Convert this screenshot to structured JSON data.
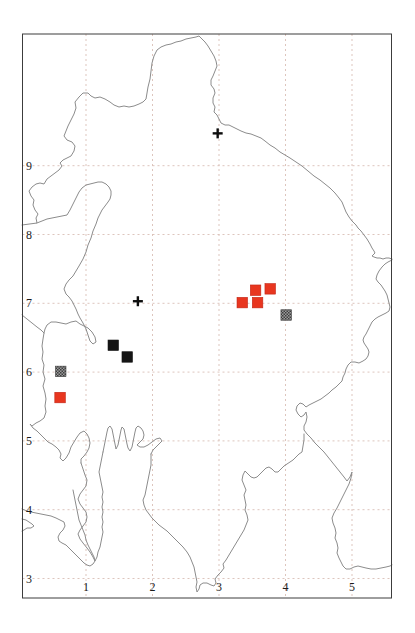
{
  "figure": {
    "kind": "grid-distribution-map",
    "background": "#ffffff"
  },
  "frame": {
    "left": 22.5,
    "top": 34,
    "right": 391.5,
    "bottom": 598,
    "stroke": "#3c3c3c",
    "stroke_width": 1
  },
  "axes": {
    "x_ticks": [
      "1",
      "2",
      "3",
      "4",
      "5"
    ],
    "y_ticks": [
      "9",
      "8",
      "7",
      "6",
      "5",
      "4",
      "3"
    ],
    "label_color": "#1c1c1c",
    "label_size": 12,
    "x_label_y": 591,
    "y_label_x": 29
  },
  "calibration": {
    "x0": 19.5,
    "x_per_unit": 66.5,
    "y_at_9": 165.7,
    "y_per_unit": 68.8
  },
  "grid": {
    "color": "#d9beb6",
    "dash": "2 3",
    "width": 0.9
  },
  "outline": {
    "color": "#8c8c8c",
    "width": 1,
    "paths": [
      "22,225 37,223 36,218 38,214 35,210 33,205 34,200 31,196 29,191 32,187 36,184 40,183 44,184 47,179 51,176 55,173 59,170 62,166 60,163 63,160 67,158 71,156 74,151 75,146 72,142 67,140 64,136 66,131 68,126 71,120 74,114 76,108 75,102 79,97 83,93 88,93 91,96 95,98 100,97 105,99 110,102 114,105 119,107 124,106 129,107 134,106 139,104 143,102 146,99 147,93 148,87 150,79 151,71 152,63 154,56 157,50 161,47 166,45 171,44 176,42 181,41 186,39 191,38 196,37 199,36 202,39 205,42 208,46 211,51 214,56 216,61 217,66 215,71 213,76 211,80 211,85 214,89 215,93 213,98 213,103 215,107 214,112 217,115 219,119 221,123 225,125 229,125 233,127 237,129 241,131 246,133 251,134 256,136 261,138 265,141 270,145 275,148 280,152 285,155 290,158 296,162 302,166 308,171 314,176 320,180 325,184 330,188 335,193 339,198 342,202 344,207 346,212 349,217 352,221 354,223 356,225 358,228 361,231 364,235 367,239 370,244 372,248 374,251 375,253 373,255 372,256 374,257 377,258 380,258 383,259 386,258 389,258 392,259",
      "392,260 388,262 385,264 382,267 379,271 377,275 376,279 378,282 381,285 383,288 385,291 387,295 388,299 389,303 390,307 389,311 386,313 382,315 378,317 375,319 372,322 370,326 368,330 366,334 364,337 363,340 364,343 366,346 368,349 369,352 368,356 366,359 363,361 359,363 355,362 351,362 348,365 346,369 345,373 343,377 342,381 339,384 336,387 332,390 329,393 325,396 321,399 317,401 313,403 309,405 306,407 303,404 300,403 297,406 296,410 298,414 301,417 304,415 306,412 307,417 306,422 304,426 304,430 307,434 311,438 315,443 319,447 324,452 328,457 332,462 336,467 340,472 344,477 347,481 350,477 352,472 351,478 349,484 346,490 343,496 340,502 337,508 334,513 332,518 333,523 335,528 336,533 335,538 337,543 338,548 337,553 339,558 341,562 343,566 346,569 350,569 354,567 358,566 362,567 366,568 371,569 376,569 381,568 386,567 390,566 392,565",
      "37,223 42,221 47,219 52,218 57,217 62,216 67,215 70,210 73,204 76,198 79,192 82,188 86,185 90,184 94,183 98,182 102,182 106,184 109,187 111,191 111,195 110,199 108,202 105,206 102,210 100,214 98,218 96,224 93,231 91,238 88,245 86,252 83,259 79,266 76,271 73,276 69,280 66,284 64,289 66,294 69,297 72,301 74,305 76,309 78,314 80,318 83,323 86,329 88,335 90,341 93,344 96,342 95,337 92,332 88,328 84,326 80,324 76,321 71,322 66,324 61,323 56,322 51,322 47,325 45,329 44,333 43,339 42,346 43,352 42,359 44,365 43,372 45,379 43,386 45,393 46,399 45,406 46,412 44,418 40,421 36,423 32,426 30,424 33,428 37,431 41,435 45,439 48,442 52,444 56,447 59,450 61,454 60,458 63,461 66,458 69,453 71,447 74,442 77,437 80,433 84,431 87,434 89,438 90,443 89,448 87,452 84,456 81,459 81,463",
      "81,463 83,469 85,475 87,480 86,486 83,490 80,494 78,499 80,504 83,508 86,512 87,517 86,522 83,526 80,530 78,534 80,539 83,543 87,548 90,552 93,557 95,561 97,557 98,552 100,547 101,542 102,537 103,532 102,527 103,522 102,517 103,512 102,507 103,502 102,497 103,492 102,487 101,482 100,477 99,472 100,467 101,462 102,457 103,452",
      "22,315 27,319 32,323 37,327 41,330 44,333",
      "103,452 104,447 105,442 106,437 107,432 108,428 110,426 112,429 113,434 114,439 115,444 116,449 118,445 119,440 120,435 121,430 122,427 124,429 125,434 126,439 127,444 128,448 130,451 132,447 133,442 134,437 135,432 136,428 138,426 141,428 143,431 144,435 143,439 140,442 137,445 140,447 144,447 148,445 152,442 156,439 160,438 162,441 159,444 156,447 153,450 151,454",
      "151,454 151,459 151,465 150,470 149,475 148,480 147,485 146,490 145,495 143,500 144,505 146,510 149,514 152,518 155,521 159,525 163,528 167,531 171,535 175,539 179,543 183,547 187,552 190,557 192,562 194,567 195,572 196,577 197,582 196,587 197,592 199,589 200,585 203,583 207,583 211,585 214,586 216,583 215,579 218,575 221,572 224,568 223,564 226,560 229,555 232,550 235,545 238,540 241,535 244,530 246,525 248,520 247,515 245,510 246,505 245,500 244,495 246,490 244,485 242,480 243,475 245,471 248,474 251,477 254,478 257,477 260,474 263,471 266,468 269,467 272,469 275,472 278,472 281,469 284,466 287,464 290,462 293,460 296,457 299,454 302,452 303,446 304,440 304,434",
      "22,509 27,511 31,512 36,513 41,514 46,515 51,516 56,518 60,520 64,522 65,526 63,530 60,533 58,537 59,541 62,543 66,545 69,548 72,551 75,554 78,557 81,560 84,563 87,565 90,566 93,564 95,561 94,557 92,553 90,549 88,545 86,540 85,535 83,530 81,525 79,520 78,515 77,510 76,505 75,500 74,495 73,490",
      "22,519 26,520 29,522 32,524 34,526 31,528 27,528 24,530 22,531"
    ]
  },
  "symbols": {
    "square_size": 10.5,
    "cross_arm": 5,
    "cross_stroke": 2.4,
    "colors": {
      "red": "#e8361f",
      "black": "#151515",
      "gray_dark": "#3d3d3d",
      "gray_light": "#9b9b9b",
      "cross": "#0d0d0d"
    },
    "points": [
      {
        "type": "cross",
        "x": 2.98,
        "y": 9.47
      },
      {
        "type": "cross",
        "x": 1.78,
        "y": 7.03
      },
      {
        "type": "red-square",
        "x": 3.55,
        "y": 7.19
      },
      {
        "type": "red-square",
        "x": 3.77,
        "y": 7.21
      },
      {
        "type": "red-square",
        "x": 3.35,
        "y": 7.01
      },
      {
        "type": "red-square",
        "x": 3.58,
        "y": 7.01
      },
      {
        "type": "red-square",
        "x": 0.61,
        "y": 5.63
      },
      {
        "type": "black-square",
        "x": 1.41,
        "y": 6.39
      },
      {
        "type": "black-square",
        "x": 1.62,
        "y": 6.22
      },
      {
        "type": "gray-square",
        "x": 4.01,
        "y": 6.83
      },
      {
        "type": "gray-square",
        "x": 0.62,
        "y": 6.01
      }
    ]
  },
  "chart_data": {
    "type": "scatter",
    "title": "",
    "xlabel": "",
    "ylabel": "",
    "x_ticks": [
      1,
      2,
      3,
      4,
      5
    ],
    "y_ticks": [
      3,
      4,
      5,
      6,
      7,
      8,
      9
    ],
    "xlim": [
      0.05,
      5.6
    ],
    "ylim": [
      2.8,
      10.9
    ],
    "grid": "dashed, light pink-gray, unit spacing",
    "legend_position": "none",
    "series": [
      {
        "name": "red-filled-square-records",
        "marker": "filled square",
        "color": "#e8361f",
        "points": [
          [
            3.55,
            7.19
          ],
          [
            3.77,
            7.21
          ],
          [
            3.35,
            7.01
          ],
          [
            3.58,
            7.01
          ],
          [
            0.61,
            5.63
          ]
        ]
      },
      {
        "name": "black-filled-square-records",
        "marker": "filled square",
        "color": "#151515",
        "points": [
          [
            1.41,
            6.39
          ],
          [
            1.62,
            6.22
          ]
        ]
      },
      {
        "name": "gray-hatched-square-records",
        "marker": "dithered gray square",
        "color": "#6c6c6c",
        "points": [
          [
            4.01,
            6.83
          ],
          [
            0.62,
            6.01
          ]
        ]
      },
      {
        "name": "cross-records",
        "marker": "plus cross",
        "color": "#0d0d0d",
        "points": [
          [
            2.98,
            9.47
          ],
          [
            1.78,
            7.03
          ]
        ]
      }
    ]
  }
}
